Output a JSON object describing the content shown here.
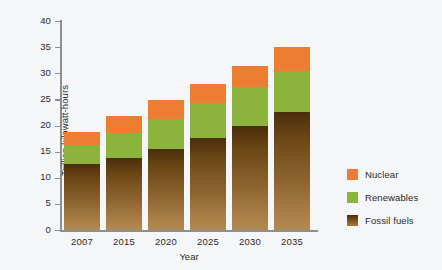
{
  "chart_data": {
    "type": "bar",
    "title": "",
    "subtitle": "",
    "xlabel": "Year",
    "ylabel": "Trillion kilowatt-hours",
    "categories": [
      "2007",
      "2015",
      "2020",
      "2025",
      "2030",
      "2035"
    ],
    "ylim": [
      0,
      40
    ],
    "yticks": [
      "0",
      "5",
      "10",
      "15",
      "20",
      "25",
      "30",
      "35",
      "40"
    ],
    "ytick_values": [
      0,
      5,
      10,
      15,
      20,
      25,
      30,
      35,
      40
    ],
    "grid": false,
    "stacked": true,
    "legend_position": "right",
    "series": [
      {
        "name": "Fossil fuels",
        "color": "#7d5420",
        "values": [
          12.7,
          13.8,
          15.5,
          17.6,
          20.0,
          22.5
        ]
      },
      {
        "name": "Renewables",
        "color": "#8cb33c",
        "values": [
          3.5,
          4.8,
          5.8,
          6.7,
          7.3,
          7.9
        ]
      },
      {
        "name": "Nuclear",
        "color": "#ed7d31",
        "values": [
          2.5,
          3.2,
          3.6,
          3.7,
          4.1,
          4.6
        ]
      }
    ],
    "stack_tops": {
      "fossil": [
        12.7,
        13.8,
        15.5,
        17.6,
        20.0,
        22.5
      ],
      "renewables": [
        16.2,
        18.6,
        21.3,
        24.3,
        27.3,
        30.4
      ],
      "total": [
        18.7,
        21.8,
        24.9,
        28.0,
        31.4,
        35.0
      ]
    },
    "legend": [
      {
        "label": "Nuclear",
        "color": "#ed7d31",
        "swatch": "nuclear"
      },
      {
        "label": "Renewables",
        "color": "#8cb33c",
        "swatch": "renew"
      },
      {
        "label": "Fossil fuels",
        "color": "#7d5420",
        "swatch": "fossil"
      }
    ]
  },
  "colors": {
    "background": "#f4f6f8",
    "axis": "#8a8f94",
    "text": "#2b2b2b",
    "nuclear": "#ed7d31",
    "renewables": "#8cb33c",
    "fossil_dark": "#4a2d0b",
    "fossil_light": "#b08a52"
  }
}
